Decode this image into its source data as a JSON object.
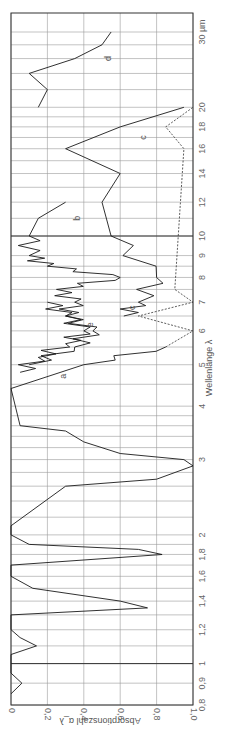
{
  "chart_data": {
    "type": "line",
    "title": "",
    "orientation": "rotated 90° (wavelength axis vertical, absorption axis horizontal)",
    "xlabel": "Wellenlänge λ",
    "x_unit": "µm",
    "x_scale": "log",
    "xlim": [
      0.8,
      30
    ],
    "x_ticks": [
      "0,8",
      "0,9",
      "1",
      "1,2",
      "1,4",
      "1,6",
      "1,8",
      "2",
      "3",
      "4",
      "5",
      "6",
      "7",
      "8",
      "9",
      "10",
      "12",
      "14",
      "16",
      "18",
      "20",
      "30 µm"
    ],
    "ylabel": "Absorptionszahl α_λ",
    "ylim": [
      0,
      1.0
    ],
    "y_ticks": [
      "0",
      "0,2",
      "0,4",
      "0,6",
      "0,8",
      "1,0"
    ],
    "grid": true,
    "series": [
      {
        "name": "a",
        "style": "solid",
        "x": [
          0.85,
          0.9,
          0.95,
          1.05,
          1.1,
          1.15,
          1.2,
          1.3,
          1.35,
          1.4,
          1.5,
          1.6,
          1.7,
          1.8,
          1.85,
          1.9,
          2.0,
          2.1,
          2.6,
          2.7,
          2.9,
          3.0,
          3.1,
          3.3,
          3.5,
          3.6,
          4.4,
          5.0,
          5.5
        ],
        "values": [
          0.0,
          0.06,
          0.0,
          0.0,
          0.14,
          0.05,
          0.0,
          0.0,
          0.75,
          0.6,
          0.12,
          0.0,
          0.0,
          0.83,
          0.7,
          0.1,
          0.0,
          0.0,
          0.3,
          0.8,
          1.0,
          0.95,
          0.6,
          0.4,
          0.3,
          0.05,
          0.0,
          0.4,
          0.85
        ]
      },
      {
        "name": "b",
        "style": "solid",
        "x": [
          4.8,
          5.2,
          5.6,
          6.0,
          6.5,
          7.0,
          7.5,
          8.0,
          8.5,
          9.0,
          10.0,
          11.0,
          12.0
        ],
        "values": [
          0.05,
          0.15,
          0.3,
          0.4,
          0.3,
          0.35,
          0.25,
          0.6,
          0.2,
          0.1,
          0.1,
          0.15,
          0.3
        ]
      },
      {
        "name": "c",
        "style": "solid",
        "x": [
          6.5,
          7.0,
          8.0,
          10.0,
          12.0,
          14.0,
          16.0,
          18.0,
          20.0
        ],
        "values": [
          0.62,
          0.7,
          0.8,
          0.55,
          0.5,
          0.6,
          0.3,
          0.6,
          0.95
        ]
      },
      {
        "name": "d",
        "style": "solid",
        "x": [
          20.0,
          22.0,
          24.0,
          26.0,
          28.0,
          30.0
        ],
        "values": [
          0.15,
          0.2,
          0.1,
          0.35,
          0.5,
          0.55
        ]
      },
      {
        "name": "e",
        "style": "solid",
        "x": [
          5.0,
          5.5,
          6.0,
          6.5,
          7.0
        ],
        "values": [
          0.1,
          0.35,
          0.45,
          0.3,
          0.2
        ]
      },
      {
        "name": "dashed",
        "style": "dashed",
        "x": [
          5.5,
          6.0,
          6.5,
          7.0,
          7.5,
          16.0,
          18.0,
          20.0
        ],
        "values": [
          0.85,
          1.0,
          0.7,
          1.0,
          0.9,
          0.95,
          0.85,
          1.0
        ]
      }
    ],
    "annotations": [
      "a",
      "b",
      "c",
      "d",
      "e",
      "c"
    ]
  }
}
